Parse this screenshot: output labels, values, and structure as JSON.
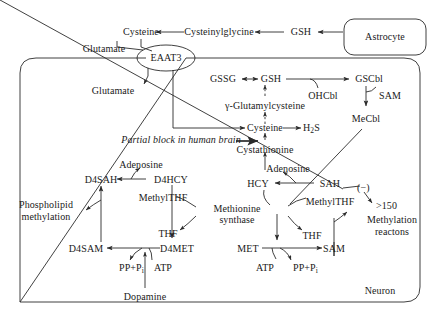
{
  "diagram": {
    "type": "biochemical-pathway",
    "compartments": [
      {
        "id": "astrocyte",
        "label": "Astrocyte",
        "shape": "rounded-rect"
      },
      {
        "id": "neuron",
        "label": "Neuron",
        "shape": "rounded-rect"
      }
    ],
    "transporter": {
      "id": "eaat3",
      "label": "EAAT3",
      "shape": "ellipse"
    },
    "enzyme": {
      "id": "methionine-synthase",
      "label_line1": "Methionine",
      "label_line2": "synthase",
      "shape": "ellipse"
    },
    "annotations": {
      "partial_block": "Partial block in human brain",
      "inhibition_sign": "(−)",
      "ratio_threshold": ">150",
      "methylation_reactions_line1": "Methylation",
      "methylation_reactions_line2": "reactons",
      "phospholipid_line1": "Phospholipid",
      "phospholipid_line2": "methylation"
    },
    "metabolites": {
      "glutamate_out": "Glutamate",
      "glutamate_in": "Glutamate",
      "cysteine_top": "Cysteine",
      "cysteinylglycine": "Cysteinylglycine",
      "gsh_astro": "GSH",
      "gssg": "GSSG",
      "gsh_neuron": "GSH",
      "gscbl": "GSCbl",
      "ohcbl": "OHCbl",
      "sam_cbl": "SAM",
      "mecbl": "MeCbl",
      "gamma_glutamylcysteine": "γ-Glutamylcysteine",
      "cysteine_mid": "Cysteine",
      "h2s": "H2S",
      "cystathionine": "Cystathionine",
      "adenosine_left": "Adenosine",
      "adenosine_right": "Adenosine",
      "d4sah": "D4SAH",
      "d4hcy": "D4HCY",
      "hcy": "HCY",
      "sah": "SAH",
      "methylthf_left": "MethylTHF",
      "methylthf_right": "MethylTHF",
      "thf_left": "THF",
      "thf_right": "THF",
      "d4sam": "D4SAM",
      "d4met": "D4MET",
      "met": "MET",
      "sam": "SAM",
      "atp_left": "ATP",
      "atp_right": "ATP",
      "ppi_left": "PP+Pi",
      "ppi_right": "PP+Pi",
      "dopamine": "Dopamine"
    },
    "colors": {
      "stroke": "#2b2b2b",
      "text": "#1a1a1a",
      "background": "#ffffff"
    }
  }
}
